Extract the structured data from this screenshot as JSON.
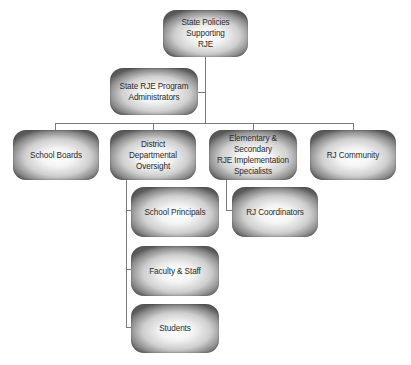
{
  "diagram": {
    "type": "org-chart",
    "nodes": {
      "root": {
        "label": "State Policies Supporting\nRJE"
      },
      "admins": {
        "label": "State RJE Program\nAdministrators"
      },
      "school_boards": {
        "label": "School Boards"
      },
      "district": {
        "label": "District\nDepartmental Oversight"
      },
      "elem_sec": {
        "label": "Elementary & Secondary\nRJE Implementation\nSpecialists"
      },
      "rj_community": {
        "label": "RJ Community"
      },
      "principals": {
        "label": "School Principals"
      },
      "rj_coordinators": {
        "label": "RJ Coordinators"
      },
      "faculty": {
        "label": "Faculty & Staff"
      },
      "students": {
        "label": "Students"
      }
    },
    "edges": [
      [
        "root",
        "admins"
      ],
      [
        "root",
        "school_boards"
      ],
      [
        "root",
        "district"
      ],
      [
        "root",
        "elem_sec"
      ],
      [
        "root",
        "rj_community"
      ],
      [
        "district",
        "principals"
      ],
      [
        "district",
        "faculty"
      ],
      [
        "district",
        "students"
      ],
      [
        "elem_sec",
        "rj_coordinators"
      ]
    ],
    "colors": {
      "connector": "#7a7a7a",
      "node_edge": "#5a5a5a",
      "node_center": "#ffffff",
      "text": "#2a2a2a"
    }
  }
}
